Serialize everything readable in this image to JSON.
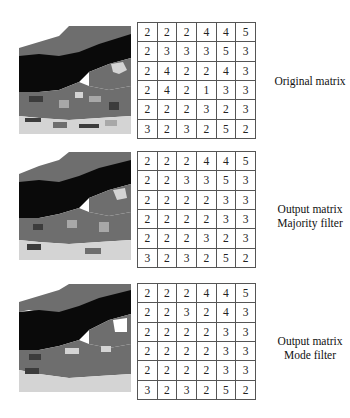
{
  "panels": [
    {
      "id": "original",
      "label_lines": [
        "Original matrix"
      ],
      "matrix": [
        [
          2,
          2,
          2,
          4,
          4,
          5
        ],
        [
          2,
          3,
          3,
          3,
          5,
          3
        ],
        [
          2,
          4,
          2,
          2,
          4,
          3
        ],
        [
          2,
          4,
          2,
          1,
          3,
          3
        ],
        [
          2,
          2,
          2,
          3,
          2,
          3
        ],
        [
          3,
          2,
          3,
          2,
          5,
          2
        ]
      ]
    },
    {
      "id": "majority",
      "label_lines": [
        "Output matrix",
        "Majority filter"
      ],
      "matrix": [
        [
          2,
          2,
          2,
          4,
          4,
          5
        ],
        [
          2,
          2,
          3,
          3,
          5,
          3
        ],
        [
          2,
          2,
          2,
          2,
          3,
          3
        ],
        [
          2,
          2,
          2,
          2,
          3,
          3
        ],
        [
          2,
          2,
          2,
          3,
          2,
          3
        ],
        [
          3,
          2,
          3,
          2,
          5,
          2
        ]
      ]
    },
    {
      "id": "mode",
      "label_lines": [
        "Output matrix",
        "Mode filter"
      ],
      "matrix": [
        [
          2,
          2,
          2,
          4,
          4,
          5
        ],
        [
          2,
          2,
          3,
          2,
          4,
          3
        ],
        [
          2,
          2,
          2,
          2,
          3,
          3
        ],
        [
          2,
          2,
          2,
          2,
          3,
          3
        ],
        [
          2,
          2,
          2,
          2,
          3,
          3
        ],
        [
          3,
          2,
          3,
          2,
          5,
          2
        ]
      ]
    }
  ],
  "colors": {
    "black": "#0a0a0a",
    "dark_gray": "#3c3c3c",
    "mid_gray": "#6e6e6e",
    "light_gray": "#a8a8a8",
    "pale_gray": "#d4d4d4",
    "grid_line": "#555555"
  }
}
